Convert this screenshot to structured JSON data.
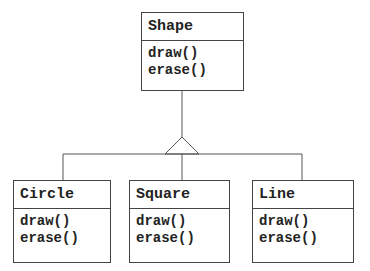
{
  "diagram": {
    "type": "uml-class-inheritance",
    "parent": {
      "name": "Shape",
      "operations": [
        "draw()",
        "erase()"
      ]
    },
    "children": [
      {
        "name": "Circle",
        "operations": [
          "draw()",
          "erase()"
        ]
      },
      {
        "name": "Square",
        "operations": [
          "draw()",
          "erase()"
        ]
      },
      {
        "name": "Line",
        "operations": [
          "draw()",
          "erase()"
        ]
      }
    ],
    "relationship": "generalization"
  },
  "colors": {
    "line": "#555555",
    "border": "#444444",
    "text": "#222222",
    "background": "#ffffff"
  }
}
